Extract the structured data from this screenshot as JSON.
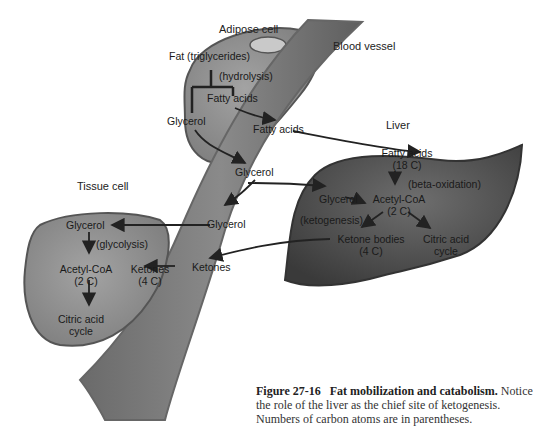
{
  "diagram": {
    "compartments": {
      "adipose": {
        "title": "Adipose cell",
        "fat": "Fat (triglycerides)",
        "process": "(hydrolysis)",
        "fatty_acids": "Fatty acids",
        "glycerol": "Glycerol"
      },
      "blood": {
        "title": "Blood vessel",
        "fatty_acids": "Fatty acids",
        "glycerol_1": "Glycerol",
        "glycerol_2": "Glycerol",
        "ketones": "Ketones"
      },
      "liver": {
        "title": "Liver",
        "fatty_acids": "Fatty acids",
        "fatty_acids_c": "(18 C)",
        "beta": "(beta-oxidation)",
        "glycerol": "Glycerol",
        "acetyl": "Acetyl-CoA",
        "acetyl_c": "(2 C)",
        "ketogenesis": "(ketogenesis)",
        "ketone_bodies": "Ketone bodies",
        "ketone_bodies_c": "(4 C)",
        "citric": "Citric acid",
        "citric_2": "cycle"
      },
      "tissue": {
        "title": "Tissue cell",
        "glycerol": "Glycerol",
        "glycolysis": "(glycolysis)",
        "acetyl": "Acetyl-CoA",
        "acetyl_c": "(2 C)",
        "ketones": "Ketones",
        "ketones_c": "(4 C)",
        "citric": "Citric acid",
        "citric_2": "cycle"
      }
    },
    "colors": {
      "cell_fill": "#8c8c8c",
      "liver_fill": "#555555",
      "vessel_fill": "#7a7a7a",
      "arrow": "#222222"
    }
  },
  "caption": {
    "figure_label": "Figure 27-16",
    "bold_title": "Fat mobilization and catabolism.",
    "text": " Notice the role of the liver as the chief site of ketogenesis. Numbers of carbon atoms are in parentheses."
  }
}
